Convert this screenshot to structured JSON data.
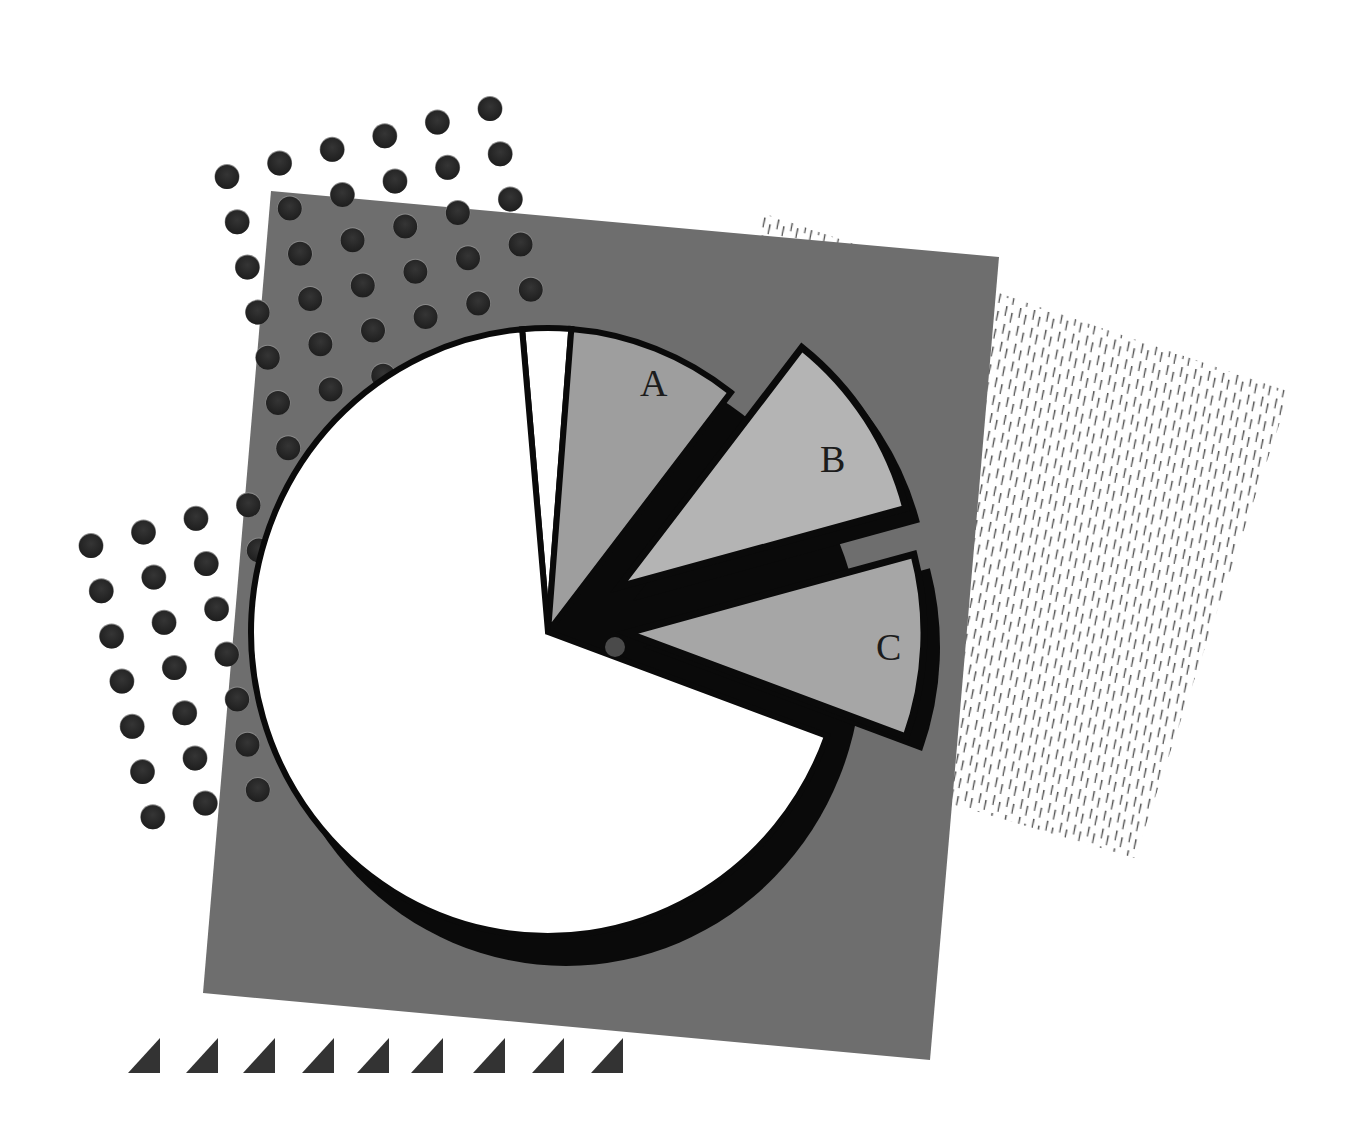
{
  "chart_data": {
    "type": "pie",
    "title": "",
    "style": "decorative exploded pie chart clip-art",
    "center": [
      548,
      632
    ],
    "radius": 300,
    "start_angle_deg": -5,
    "direction": "clockwise",
    "slices": [
      {
        "label": "",
        "value": 2.6,
        "start_deg": -5,
        "end_deg": 4.5,
        "fill": "#ffffff",
        "exploded": false
      },
      {
        "label": "A",
        "value": 9.2,
        "start_deg": 4.5,
        "end_deg": 38,
        "fill": "#9e9e9e",
        "exploded": false
      },
      {
        "label": "B",
        "value": 10.3,
        "start_deg": 38,
        "end_deg": 75,
        "fill": "#b4b4b4",
        "exploded": true
      },
      {
        "label": "C",
        "value": 9.7,
        "start_deg": 75,
        "end_deg": 110,
        "fill": "#a6a6a6",
        "exploded": true
      },
      {
        "label": "",
        "value": 68.2,
        "start_deg": 110,
        "end_deg": 355,
        "fill": "#ffffff",
        "exploded": false
      }
    ],
    "legend": "none",
    "value_labels": "none (values estimated from slice angles)"
  },
  "labels": {
    "slice_a": "A",
    "slice_b": "B",
    "slice_c": "C"
  },
  "colors": {
    "background": "#ffffff",
    "backdrop_square": "#6e6e6e",
    "dot": "#2a2a2a",
    "outline": "#0a0a0a",
    "hatch": "#5a5a5a",
    "triangle": "#333333"
  },
  "decorations": {
    "dot_clusters": 2,
    "triangle_count": 9,
    "hatched_square": true
  }
}
